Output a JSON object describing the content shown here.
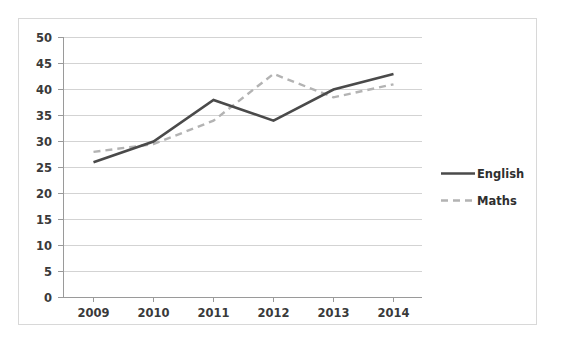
{
  "chart_data": {
    "type": "line",
    "title": "",
    "xlabel": "",
    "ylabel": "",
    "categories": [
      "2009",
      "2010",
      "2011",
      "2012",
      "2013",
      "2014"
    ],
    "series": [
      {
        "name": "English",
        "values": [
          26,
          30,
          38,
          34,
          40,
          43
        ],
        "color": "#4a4a4a",
        "style": "solid"
      },
      {
        "name": "Maths",
        "values": [
          28,
          29.5,
          34,
          43,
          38.5,
          41
        ],
        "color": "#b3b3b3",
        "style": "dashed"
      }
    ],
    "ylim": [
      0,
      50
    ],
    "ytick_values": [
      0,
      5,
      10,
      15,
      20,
      25,
      30,
      35,
      40,
      45,
      50
    ],
    "ytick_labels": [
      "0",
      "5",
      "10",
      "15",
      "20",
      "25",
      "30",
      "35",
      "40",
      "45",
      "50"
    ],
    "xtick_labels": [
      "2009",
      "2010",
      "2011",
      "2012",
      "2013",
      "2014"
    ],
    "grid": "horizontal",
    "legend_position": "right",
    "legend_entries": [
      "English",
      "Maths"
    ],
    "frame_border_color": "#d8d8d8",
    "gridline_color": "#d3d3d3",
    "axis_color": "#9a9a9a",
    "background_color": "#ffffff"
  },
  "axis": {
    "y_labels": {
      "v50": "50",
      "v45": "45",
      "v40": "40",
      "v35": "35",
      "v30": "30",
      "v25": "25",
      "v20": "20",
      "v15": "15",
      "v10": "10",
      "v5": "5",
      "v0": "0"
    },
    "x_labels": {
      "y2009": "2009",
      "y2010": "2010",
      "y2011": "2011",
      "y2012": "2012",
      "y2013": "2013",
      "y2014": "2014"
    }
  },
  "legend": {
    "english_label": "English",
    "maths_label": "Maths"
  }
}
